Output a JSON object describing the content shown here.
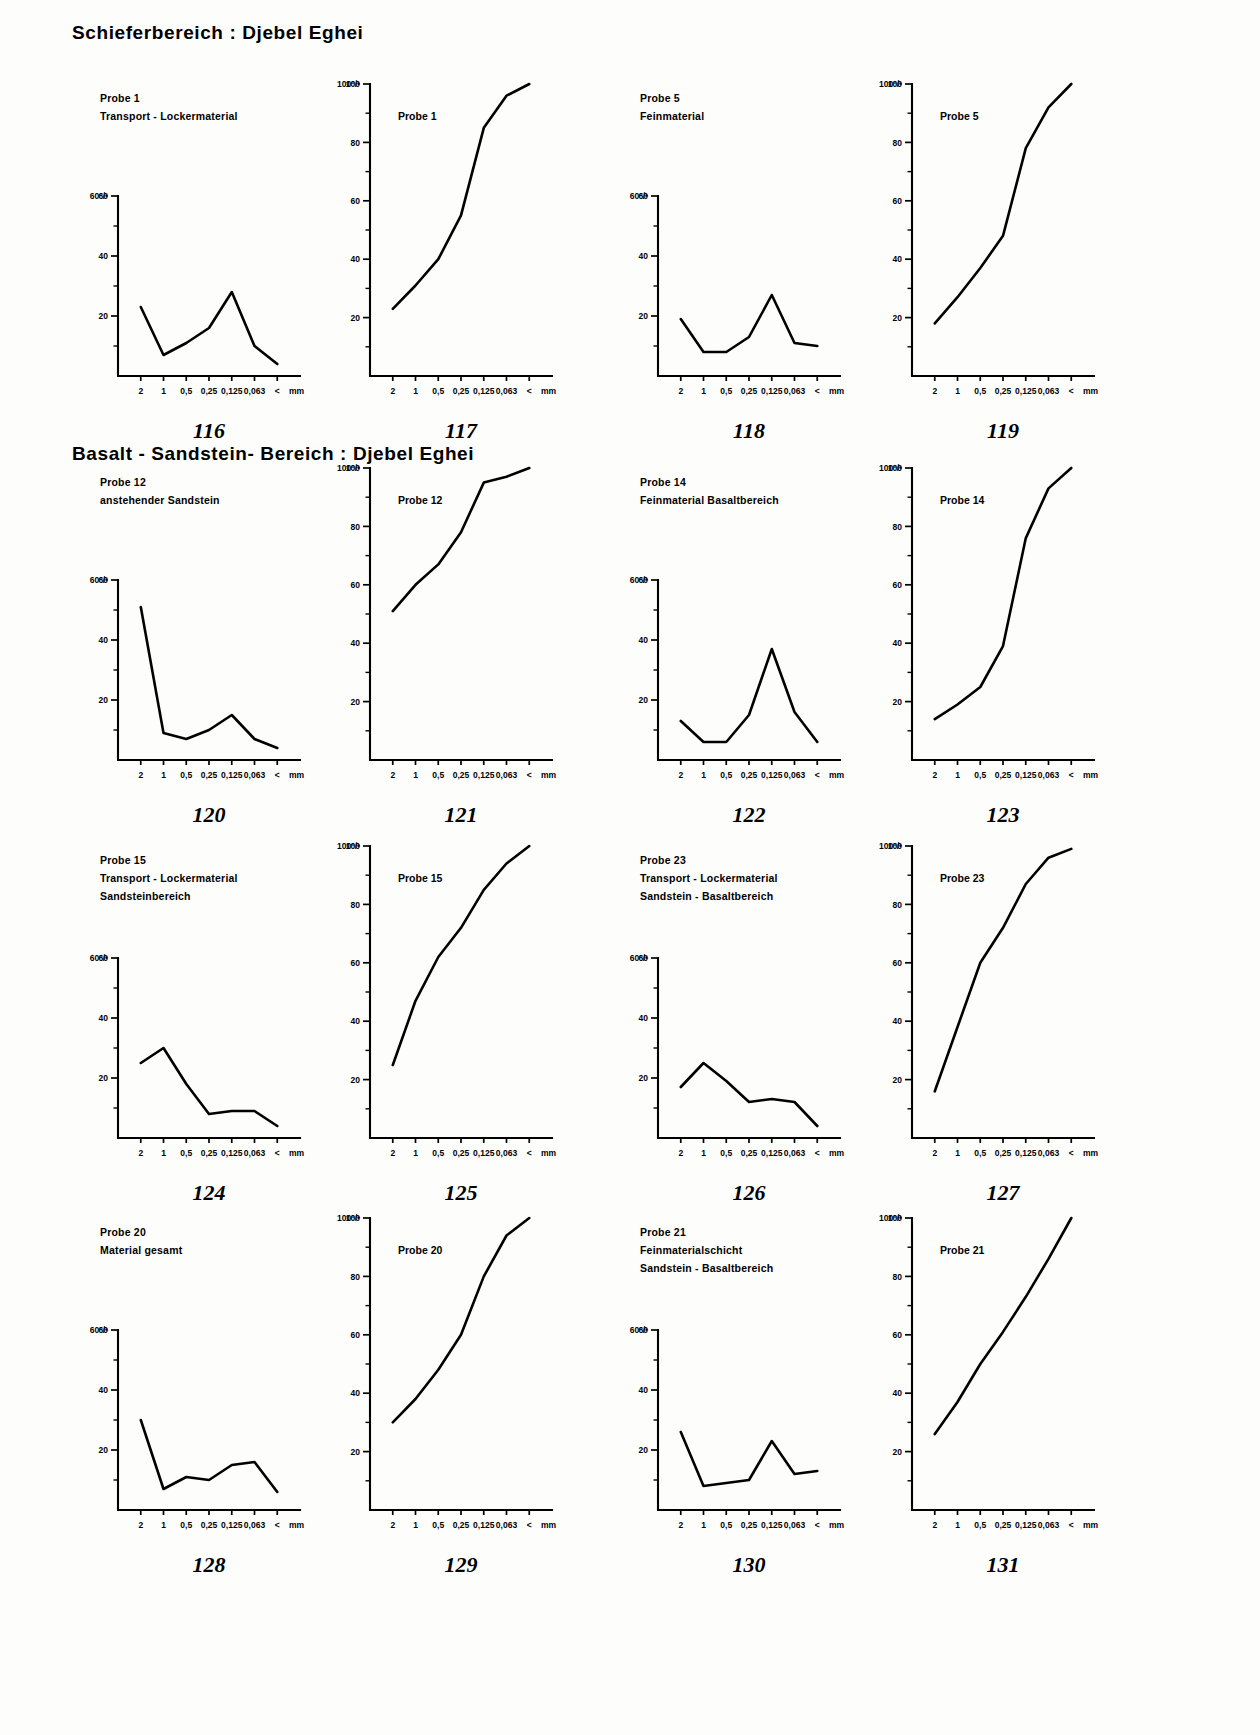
{
  "sections": [
    {
      "title": "Schieferbereich : Djebel  Eghei",
      "x": 72,
      "y": 22
    },
    {
      "title": "Basalt - Sandstein- Bereich : Djebel  Eghei",
      "x": 72,
      "y": 443
    }
  ],
  "axis": {
    "x_ticks": [
      "2",
      "1",
      "0,5",
      "0,25",
      "0,125",
      "0,063",
      "<",
      "mm"
    ],
    "y_freq_ticks": [
      "60%",
      "40",
      "20"
    ],
    "y_cum_ticks": [
      "100%",
      "80",
      "60",
      "40",
      "20"
    ],
    "y_freq_top_label": "60°/•",
    "y_cum_top_label": "100°/•"
  },
  "chart_data": [
    {
      "id": "116",
      "type": "line",
      "ylim": [
        0,
        60
      ],
      "grid": false,
      "legend": "none",
      "title": "Probe 1",
      "subtitle": "Transport - Lockermaterial",
      "caption_lines": [
        "Probe 1",
        "Transport - Lockermaterial"
      ],
      "caption_position": "above-left",
      "xlabel": "mm",
      "ylabel": "60°/•",
      "categories": [
        "2",
        "1",
        "0,5",
        "0,25",
        "0,125",
        "0,063",
        "<"
      ],
      "values": [
        23,
        7,
        11,
        16,
        28,
        10,
        4
      ]
    },
    {
      "id": "117",
      "type": "line",
      "ylim": [
        0,
        100
      ],
      "grid": false,
      "legend": "none",
      "title": "Probe 1",
      "subtitle": "",
      "caption_lines": [
        "Probe 1"
      ],
      "caption_position": "inside",
      "xlabel": "mm",
      "ylabel": "100°/•",
      "categories": [
        "2",
        "1",
        "0,5",
        "0,25",
        "0,125",
        "0,063",
        "<"
      ],
      "values": [
        23,
        31,
        40,
        55,
        85,
        96,
        100
      ]
    },
    {
      "id": "118",
      "type": "line",
      "ylim": [
        0,
        60
      ],
      "grid": false,
      "legend": "none",
      "title": "Probe 5",
      "subtitle": "Feinmaterial",
      "caption_lines": [
        "Probe 5",
        "Feinmaterial"
      ],
      "caption_position": "above-left",
      "xlabel": "mm",
      "ylabel": "60°/•",
      "categories": [
        "2",
        "1",
        "0,5",
        "0,25",
        "0,125",
        "0,063",
        "<"
      ],
      "values": [
        19,
        8,
        8,
        13,
        27,
        11,
        10
      ]
    },
    {
      "id": "119",
      "type": "line",
      "ylim": [
        0,
        100
      ],
      "grid": false,
      "legend": "none",
      "title": "Probe 5",
      "subtitle": "",
      "caption_lines": [
        "Probe 5"
      ],
      "caption_position": "inside",
      "xlabel": "mm",
      "ylabel": "100°/•",
      "categories": [
        "2",
        "1",
        "0,5",
        "0,25",
        "0,125",
        "0,063",
        "<"
      ],
      "values": [
        18,
        27,
        37,
        48,
        78,
        92,
        100
      ]
    },
    {
      "id": "120",
      "type": "line",
      "ylim": [
        0,
        60
      ],
      "grid": false,
      "legend": "none",
      "title": "Probe 12",
      "subtitle": "anstehender  Sandstein",
      "caption_lines": [
        "Probe 12",
        "anstehender  Sandstein"
      ],
      "caption_position": "above-left",
      "xlabel": "mm",
      "ylabel": "60°/•",
      "categories": [
        "2",
        "1",
        "0,5",
        "0,25",
        "0,125",
        "0,063",
        "<"
      ],
      "values": [
        51,
        9,
        7,
        10,
        15,
        7,
        4
      ]
    },
    {
      "id": "121",
      "type": "line",
      "ylim": [
        0,
        100
      ],
      "grid": false,
      "legend": "none",
      "title": "Probe 12",
      "subtitle": "",
      "caption_lines": [
        "Probe 12"
      ],
      "caption_position": "inside",
      "xlabel": "mm",
      "ylabel": "100°/•",
      "categories": [
        "2",
        "1",
        "0,5",
        "0,25",
        "0,125",
        "0,063",
        "<"
      ],
      "values": [
        51,
        60,
        67,
        78,
        95,
        97,
        100
      ]
    },
    {
      "id": "122",
      "type": "line",
      "ylim": [
        0,
        60
      ],
      "grid": false,
      "legend": "none",
      "title": "Probe 14",
      "subtitle": "Feinmaterial  Basaltbereich",
      "caption_lines": [
        "Probe 14",
        "Feinmaterial  Basaltbereich"
      ],
      "caption_position": "above-left",
      "xlabel": "mm",
      "ylabel": "60°/•",
      "categories": [
        "2",
        "1",
        "0,5",
        "0,25",
        "0,125",
        "0,063",
        "<"
      ],
      "values": [
        13,
        6,
        6,
        15,
        37,
        16,
        6
      ]
    },
    {
      "id": "123",
      "type": "line",
      "ylim": [
        0,
        100
      ],
      "grid": false,
      "legend": "none",
      "title": "Probe 14",
      "subtitle": "",
      "caption_lines": [
        "Probe 14"
      ],
      "caption_position": "inside",
      "xlabel": "mm",
      "ylabel": "100°/•",
      "categories": [
        "2",
        "1",
        "0,5",
        "0,25",
        "0,125",
        "0,063",
        "<"
      ],
      "values": [
        14,
        19,
        25,
        39,
        76,
        93,
        100
      ]
    },
    {
      "id": "124",
      "type": "line",
      "ylim": [
        0,
        60
      ],
      "grid": false,
      "legend": "none",
      "title": "Probe 15",
      "subtitle": "Transport - Lockermaterial",
      "caption_lines": [
        "Probe 15",
        "Transport - Lockermaterial",
        "Sandsteinbereich"
      ],
      "caption_position": "above-left",
      "xlabel": "mm",
      "ylabel": "60°/•",
      "categories": [
        "2",
        "1",
        "0,5",
        "0,25",
        "0,125",
        "0,063",
        "<"
      ],
      "values": [
        25,
        30,
        18,
        8,
        9,
        9,
        4
      ]
    },
    {
      "id": "125",
      "type": "line",
      "ylim": [
        0,
        100
      ],
      "grid": false,
      "legend": "none",
      "title": "Probe 15",
      "subtitle": "",
      "caption_lines": [
        "Probe 15"
      ],
      "caption_position": "inside",
      "xlabel": "mm",
      "ylabel": "100°/•",
      "categories": [
        "2",
        "1",
        "0,5",
        "0,25",
        "0,125",
        "0,063",
        "<"
      ],
      "values": [
        25,
        47,
        62,
        72,
        85,
        94,
        100
      ]
    },
    {
      "id": "126",
      "type": "line",
      "ylim": [
        0,
        60
      ],
      "grid": false,
      "legend": "none",
      "title": "Probe 23",
      "subtitle": "Transport - Lockermaterial",
      "caption_lines": [
        "Probe 23",
        "Transport - Lockermaterial",
        "Sandstein - Basaltbereich"
      ],
      "caption_position": "above-left",
      "xlabel": "mm",
      "ylabel": "60°/•",
      "categories": [
        "2",
        "1",
        "0,5",
        "0,25",
        "0,125",
        "0,063",
        "<"
      ],
      "values": [
        17,
        25,
        19,
        12,
        13,
        12,
        4
      ]
    },
    {
      "id": "127",
      "type": "line",
      "ylim": [
        0,
        100
      ],
      "grid": false,
      "legend": "none",
      "title": "Probe 23",
      "subtitle": "",
      "caption_lines": [
        "Probe 23"
      ],
      "caption_position": "inside",
      "xlabel": "mm",
      "ylabel": "100°/•",
      "categories": [
        "2",
        "1",
        "0,5",
        "0,25",
        "0,125",
        "0,063",
        "<"
      ],
      "values": [
        16,
        38,
        60,
        72,
        87,
        96,
        99
      ]
    },
    {
      "id": "128",
      "type": "line",
      "ylim": [
        0,
        60
      ],
      "grid": false,
      "legend": "none",
      "title": "Probe 20",
      "subtitle": "Material gesamt",
      "caption_lines": [
        "Probe 20",
        "Material gesamt"
      ],
      "caption_position": "above-left",
      "xlabel": "mm",
      "ylabel": "60°/•",
      "categories": [
        "2",
        "1",
        "0,5",
        "0,25",
        "0,125",
        "0,063",
        "<"
      ],
      "values": [
        30,
        7,
        11,
        10,
        15,
        16,
        6
      ]
    },
    {
      "id": "129",
      "type": "line",
      "ylim": [
        0,
        100
      ],
      "grid": false,
      "legend": "none",
      "title": "Probe 20",
      "subtitle": "",
      "caption_lines": [
        "Probe 20"
      ],
      "caption_position": "inside",
      "xlabel": "mm",
      "ylabel": "100°/•",
      "categories": [
        "2",
        "1",
        "0,5",
        "0,25",
        "0,125",
        "0,063",
        "<"
      ],
      "values": [
        30,
        38,
        48,
        60,
        80,
        94,
        100
      ]
    },
    {
      "id": "130",
      "type": "line",
      "ylim": [
        0,
        60
      ],
      "grid": false,
      "legend": "none",
      "title": "Probe 21",
      "subtitle": "Feinmaterialschicht",
      "caption_lines": [
        "Probe 21",
        "Feinmaterialschicht",
        "Sandstein - Basaltbereich"
      ],
      "caption_position": "above-left",
      "xlabel": "mm",
      "ylabel": "60°/•",
      "categories": [
        "2",
        "1",
        "0,5",
        "0,25",
        "0,125",
        "0,063",
        "<"
      ],
      "values": [
        26,
        8,
        9,
        10,
        23,
        12,
        13
      ]
    },
    {
      "id": "131",
      "type": "line",
      "ylim": [
        0,
        100
      ],
      "grid": false,
      "legend": "none",
      "title": "Probe 21",
      "subtitle": "",
      "caption_lines": [
        "Probe 21"
      ],
      "caption_position": "inside",
      "xlabel": "mm",
      "ylabel": "100°/•",
      "categories": [
        "2",
        "1",
        "0,5",
        "0,25",
        "0,125",
        "0,063",
        "<"
      ],
      "values": [
        26,
        37,
        50,
        61,
        73,
        86,
        100
      ]
    }
  ],
  "figure_numbers": [
    "116",
    "117",
    "118",
    "119",
    "120",
    "121",
    "122",
    "123",
    "124",
    "125",
    "126",
    "127",
    "128",
    "129",
    "130",
    "131"
  ],
  "colors": {
    "ink": "#000000",
    "paper": "#fdfdfb"
  }
}
